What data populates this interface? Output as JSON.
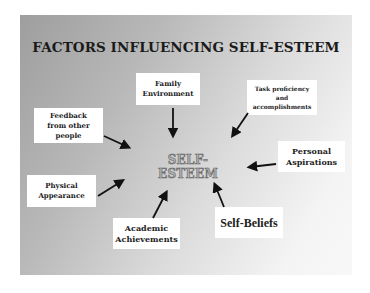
{
  "title": "FACTORS INFLUENCING SELF-ESTEEM",
  "center": "SELF-ESTEEM",
  "factors": {
    "family": {
      "line1": "Family",
      "line2": "Environment"
    },
    "task": {
      "line1": "Task proficiency",
      "line2": "and",
      "line3": "accomplishments"
    },
    "feedback": {
      "line1": "Feedback",
      "line2": "from other",
      "line3": "people"
    },
    "aspirations": {
      "line1": "Personal",
      "line2": "Aspirations"
    },
    "physical": {
      "line1": "Physical",
      "line2": "Appearance"
    },
    "academic": {
      "line1": "Academic",
      "line2": "Achievements"
    },
    "beliefs": {
      "line1": "Self-Beliefs"
    }
  },
  "colors": {
    "background_dark": "#9e9e9e",
    "background_light": "#f8f8f8",
    "box": "#ffffff",
    "arrow": "#111111",
    "center_text": "#b0b0b0"
  }
}
